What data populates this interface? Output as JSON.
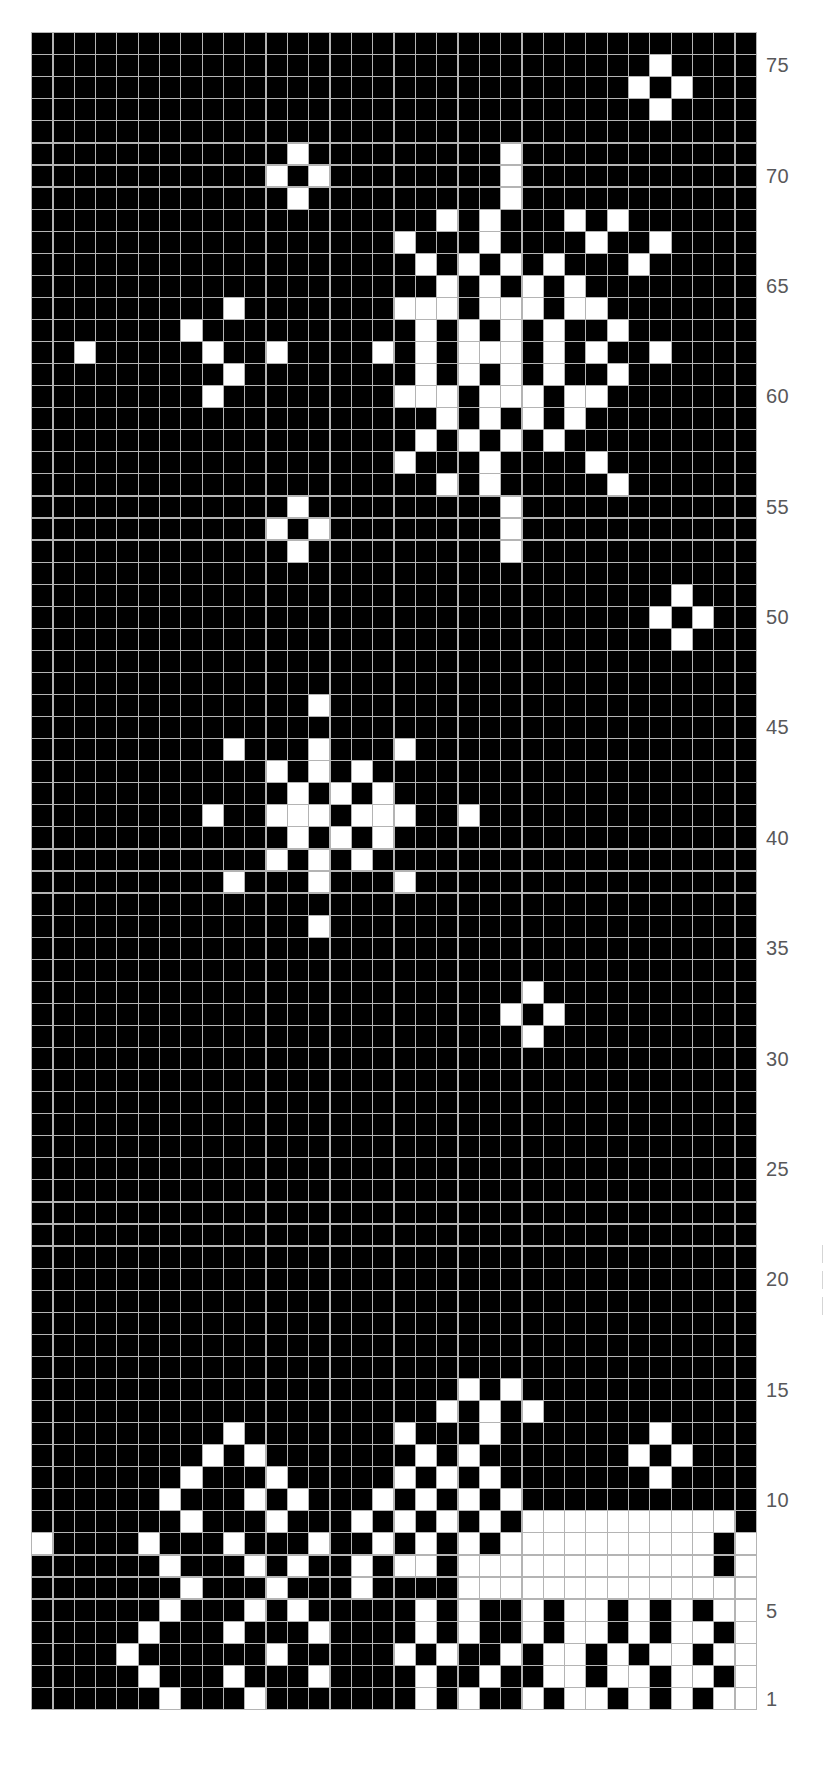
{
  "chart_data": {
    "type": "heatmap",
    "title": "",
    "subtitle": "",
    "xlabel": "",
    "ylabel": "",
    "grid": true,
    "legend": "none",
    "colors": {
      "background": "#000000",
      "stitch": "#ffffff",
      "gridline": "#b4b4b4",
      "label": "#58585a",
      "page": "#ffffff"
    },
    "columns": 34,
    "rows": 77,
    "row_numbering": "bottom-up",
    "axis": {
      "tick_labels": [
        "1",
        "5",
        "10",
        "15",
        "20",
        "25",
        "30",
        "35",
        "40",
        "45",
        "50",
        "55",
        "60",
        "65",
        "70",
        "75"
      ],
      "tick_rows": [
        1,
        5,
        10,
        15,
        20,
        25,
        30,
        35,
        40,
        45,
        50,
        55,
        60,
        65,
        70,
        75
      ],
      "position": "right",
      "ylim": [
        1,
        77
      ]
    },
    "cells_note": "matrix rows are listed top (row 77) to bottom (row 1); 1 = white stitch, 0 = black ground",
    "matrix": [
      "0000000000000000000000000000000000",
      "0000000000000000000000000000010000",
      "0000000000000000000000000000101000",
      "0000000000000000000000000000010000",
      "0000000000000000000000000000000000",
      "0000000000001000000000100000000000",
      "0000000000010100000000100000000000",
      "0000000000001000000000100000000000",
      "0000000000000000000101000101000000",
      "0000000000000000010001000010010000",
      "0000000000000000001010101000100000",
      "0000000000000000000101010100000000",
      "0000000001000000011101110110000000",
      "0000000100000000001010101001000000",
      "0010000010010000101011101010010000",
      "0000000001000000001010101001000000",
      "0000000010000000011101110110000000",
      "0000000000000000000101010100000000",
      "0000000000000000001010101000000000",
      "0000000000000000010001000010000000",
      "0000000000000000000101000001000000",
      "0000000000001000000000100000000000",
      "0000000000010100000000100000000000",
      "0000000000001000000000100000000000",
      "0000000000000000000000000000000000",
      "0000000000000000000000000000001000",
      "0000000000000000000000000000010100",
      "0000000000000000000000000000001000",
      "0000000000000000000000000000000000",
      "0000000000000000000000000000000000",
      "0000000000000100000000000000000000",
      "0000000000000000000000000000000000",
      "0000000001000100010000000000000000",
      "0000000000010101000000000000000000",
      "0000000000001010100000000000000000",
      "0000000010011101110010000000000000",
      "0000000000001010100000000000000000",
      "0000000000010101000000000000000000",
      "0000000001000100010000000000000000",
      "0000000000000000000000000000000000",
      "0000000000000100000000000000000000",
      "0000000000000000000000000000000000",
      "0000000000000000000000000000000000",
      "0000000000000000000000010000000000",
      "0000000000000000000000101000000000",
      "0000000000000000000000010000000000",
      "0000000000000000000000000000000000",
      "0000000000000000000000000000000000",
      "0000000000000000000000000000000000",
      "0000000000000000000000000000000000",
      "0000000000000000000000000000000000",
      "0000000000000000000000000000000000",
      "0000000000000000000000000000000000",
      "0000000000000000000000000000000000",
      "0000000000000000000000000000000000",
      "0000000000000000000000000000000000",
      "0000000000000000000000000000000000",
      "0000000000000000000000000000000000",
      "0000000000000000000000000000000000",
      "0000000000000000000000000000000000",
      "0000000000000000000000000000000000",
      "0000000000000000000010100000000000",
      "0000000000000000000101010000000000",
      "0000000001000000010001000000010000",
      "0000000010100000001010000000101000",
      "0000000100010000010101000000010000",
      "0000001000101000101010100000000000",
      "0000000100010001010101011111111110",
      "1000010001000100101010111111111101",
      "0000001000101001011011111111111101",
      "0000000100010001000011111111111111",
      "0000001000101000001010010110101011",
      "0000010001000100001010010110101101",
      "0000100000010000010100101101011011",
      "0000010001000100001001001101101101",
      "0000001000100000001010010110101011"
    ]
  },
  "labels": [
    {
      "text": "75",
      "row": 75
    },
    {
      "text": "70",
      "row": 70
    },
    {
      "text": "65",
      "row": 65
    },
    {
      "text": "60",
      "row": 60
    },
    {
      "text": "55",
      "row": 55
    },
    {
      "text": "50",
      "row": 50
    },
    {
      "text": "45",
      "row": 45
    },
    {
      "text": "40",
      "row": 40
    },
    {
      "text": "35",
      "row": 35
    },
    {
      "text": "30",
      "row": 30
    },
    {
      "text": "25",
      "row": 25
    },
    {
      "text": "20",
      "row": 20
    },
    {
      "text": "15",
      "row": 15
    },
    {
      "text": "10",
      "row": 10
    },
    {
      "text": "5",
      "row": 5
    },
    {
      "text": "1",
      "row": 1
    }
  ]
}
